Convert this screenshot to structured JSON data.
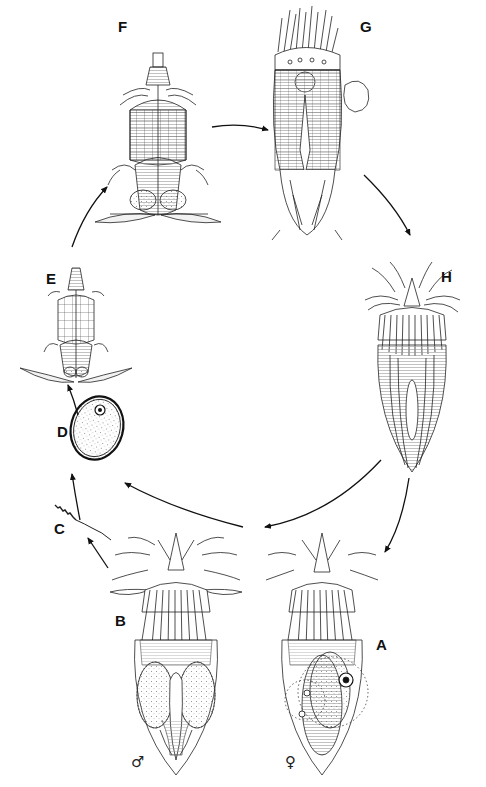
{
  "diagram": {
    "type": "life-cycle",
    "stages": [
      {
        "id": "A",
        "label": "A",
        "sex": "♀",
        "description": "adult female"
      },
      {
        "id": "B",
        "label": "B",
        "sex": "♂",
        "description": "adult male"
      },
      {
        "id": "C",
        "label": "C",
        "description": "spermatozoon"
      },
      {
        "id": "D",
        "label": "D",
        "description": "egg"
      },
      {
        "id": "E",
        "label": "E",
        "description": "larva"
      },
      {
        "id": "F",
        "label": "F",
        "description": "larva"
      },
      {
        "id": "G",
        "label": "G",
        "description": "larva with exuvia"
      },
      {
        "id": "H",
        "label": "H",
        "description": "adult (post-metamorphosis)"
      }
    ],
    "flow": [
      [
        "A",
        "D"
      ],
      [
        "B",
        "C"
      ],
      [
        "C",
        "D"
      ],
      [
        "D",
        "E"
      ],
      [
        "E",
        "F"
      ],
      [
        "F",
        "G"
      ],
      [
        "G",
        "H"
      ],
      [
        "H",
        "A"
      ],
      [
        "H",
        "B"
      ]
    ],
    "labels": {
      "A": "A",
      "B": "B",
      "C": "C",
      "D": "D",
      "E": "E",
      "F": "F",
      "G": "G",
      "H": "H",
      "male": "♂",
      "female": "♀"
    }
  }
}
